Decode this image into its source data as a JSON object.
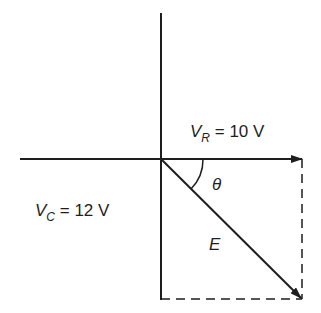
{
  "diagram": {
    "type": "phasor-diagram",
    "stroke_color": "#1e1e1e",
    "labels": {
      "vr": {
        "symbol": "V",
        "subscript": "R",
        "equals": "= 10 V"
      },
      "vc": {
        "symbol": "V",
        "subscript": "C",
        "equals": "= 12 V"
      },
      "e": "E",
      "theta": "θ"
    },
    "values": {
      "VR_volts": 10,
      "VC_volts": 12
    }
  }
}
